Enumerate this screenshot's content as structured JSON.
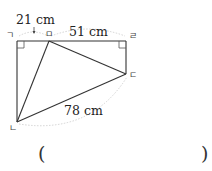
{
  "figure": {
    "points": {
      "top_left": {
        "label": "ㄱ",
        "x": 17,
        "y": 41
      },
      "top_mid": {
        "label": "ㅁ",
        "x": 49,
        "y": 41
      },
      "top_right": {
        "label": "ㄹ",
        "x": 126,
        "y": 41
      },
      "right": {
        "label": "ㄷ",
        "x": 126,
        "y": 74
      },
      "bottom_left": {
        "label": "ㄴ",
        "x": 17,
        "y": 122
      }
    },
    "measurements": {
      "top_left_segment": "21 cm",
      "top_right_segment": "51 cm",
      "diagonal_bottom": "78 cm"
    },
    "right_angles": [
      "top_left",
      "top_right"
    ]
  },
  "answer": {
    "open_paren": "(",
    "close_paren": ")",
    "value": ""
  }
}
